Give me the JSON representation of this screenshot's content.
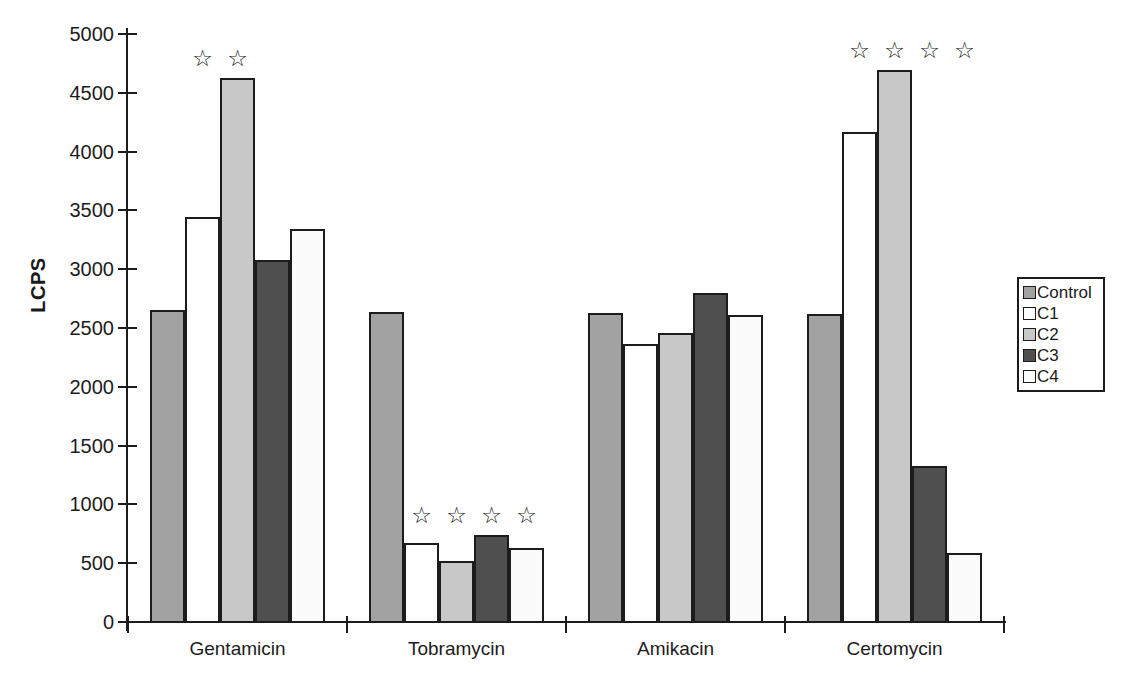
{
  "chart_data": {
    "type": "bar",
    "title": "",
    "xlabel": "",
    "ylabel": "LCPS",
    "categories": [
      "Gentamicin",
      "Tobramycin",
      "Amikacin",
      "Certomycin"
    ],
    "series": [
      {
        "name": "Control",
        "color": "#a2a2a2",
        "values": [
          2650,
          2640,
          2630,
          2620
        ]
      },
      {
        "name": "C1",
        "color": "#ffffff",
        "values": [
          3440,
          670,
          2360,
          4170
        ]
      },
      {
        "name": "C2",
        "color": "#c8c8c8",
        "values": [
          4630,
          520,
          2460,
          4690
        ]
      },
      {
        "name": "C3",
        "color": "#4f4f4f",
        "values": [
          3080,
          740,
          2800,
          1330
        ]
      },
      {
        "name": "C4",
        "color": "#fbfbfb",
        "values": [
          3340,
          630,
          2610,
          590
        ]
      }
    ],
    "ylim": [
      0,
      5000
    ],
    "yticks": [
      0,
      500,
      1000,
      1500,
      2000,
      2500,
      3000,
      3500,
      4000,
      4500,
      5000
    ],
    "grid": false,
    "legend_position": "right",
    "legend_entries": [
      "Control",
      "C1",
      "C2",
      "C3",
      "C4"
    ],
    "significance": {
      "marker": "☆",
      "per_group": [
        [
          "C1",
          "C2"
        ],
        [
          "C1",
          "C2",
          "C3",
          "C4"
        ],
        [],
        [
          "C1",
          "C2",
          "C3",
          "C4"
        ]
      ]
    },
    "axis_color": "#1c1c1c"
  }
}
